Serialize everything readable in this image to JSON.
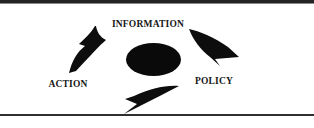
{
  "diagram": {
    "type": "cycle",
    "nodes": [
      {
        "label": "INFORMATION",
        "position": "top"
      },
      {
        "label": "POLICY",
        "position": "right"
      },
      {
        "label": "ACTION",
        "position": "left"
      }
    ],
    "center_shape": "filled-ellipse",
    "arrows": [
      {
        "icon": "curved-arrow-up-icon",
        "from": "ACTION",
        "to": "INFORMATION"
      },
      {
        "icon": "curved-arrow-down-right-icon",
        "from": "INFORMATION",
        "to": "POLICY"
      },
      {
        "icon": "curved-arrow-left-icon",
        "from": "POLICY",
        "to": "ACTION"
      }
    ],
    "colors": {
      "foreground": "#0a0a0a",
      "background": "#ffffff",
      "top_rule": "#242424",
      "bottom_rule": "#2f2f2f"
    }
  }
}
